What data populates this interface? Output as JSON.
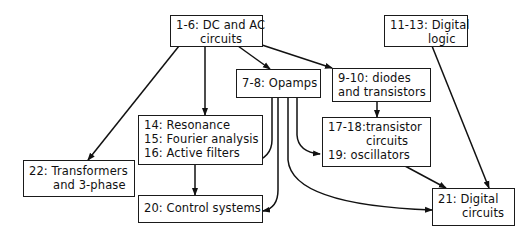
{
  "diagram": {
    "type": "course-topic-dependency-graph",
    "nodes": [
      {
        "id": "n1",
        "lines": [
          "1-6: DC and AC",
          "circuits"
        ]
      },
      {
        "id": "n2",
        "lines": [
          "11-13: Digital",
          "logic"
        ]
      },
      {
        "id": "n3",
        "lines": [
          "7-8: Opamps"
        ]
      },
      {
        "id": "n4",
        "lines": [
          "9-10: diodes",
          "and transistors"
        ]
      },
      {
        "id": "n5",
        "lines": [
          "14: Resonance",
          "15: Fourier analysis",
          "16: Active filters"
        ]
      },
      {
        "id": "n6",
        "lines": [
          "22: Transformers",
          "and 3-phase"
        ]
      },
      {
        "id": "n7",
        "lines": [
          "17-18:transistor",
          "circuits",
          "19: oscillators"
        ]
      },
      {
        "id": "n8",
        "lines": [
          "20: Control systems"
        ]
      },
      {
        "id": "n9",
        "lines": [
          "21: Digital",
          "circuits"
        ]
      }
    ],
    "edges": [
      {
        "from": "1-6: DC and AC circuits",
        "to": "22: Transformers and 3-phase"
      },
      {
        "from": "1-6: DC and AC circuits",
        "to": "14-16: Resonance / Fourier / Active filters"
      },
      {
        "from": "1-6: DC and AC circuits",
        "to": "7-8: Opamps"
      },
      {
        "from": "1-6: DC and AC circuits",
        "to": "9-10: diodes and transistors"
      },
      {
        "from": "9-10: diodes and transistors",
        "to": "17-19: transistor circuits / oscillators"
      },
      {
        "from": "7-8: Opamps",
        "to": "16: Active filters"
      },
      {
        "from": "7-8: Opamps",
        "to": "20: Control systems"
      },
      {
        "from": "7-8: Opamps",
        "to": "19: oscillators"
      },
      {
        "from": "7-8: Opamps",
        "to": "21: Digital circuits"
      },
      {
        "from": "14-16",
        "to": "20: Control systems"
      },
      {
        "from": "17-19",
        "to": "21: Digital circuits"
      },
      {
        "from": "11-13: Digital logic",
        "to": "21: Digital circuits"
      }
    ]
  }
}
